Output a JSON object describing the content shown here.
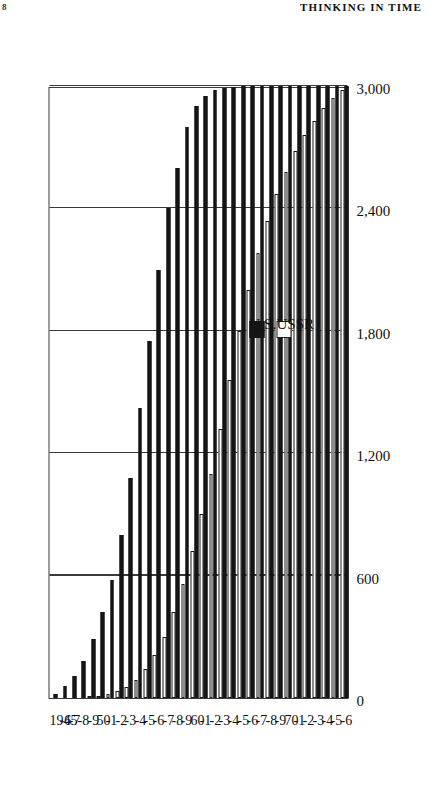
{
  "page": {
    "page_number": "8",
    "running_head": "THINKING IN TIME"
  },
  "legend": {
    "items": [
      {
        "label": "U.S.",
        "swatch": "filled-black-square",
        "color": "#151515"
      },
      {
        "label": "USSR",
        "swatch": "outline-white-square",
        "color": "#ffffff"
      }
    ]
  },
  "chart_data": {
    "type": "bar",
    "orientation": "horizontal",
    "title": "",
    "xlabel": "",
    "ylabel": "",
    "grid": true,
    "legend_position": "inside-left",
    "value_axis": {
      "ticks": [
        "0",
        "600",
        "1,200",
        "1,800",
        "2,400",
        "3,000"
      ],
      "values": [
        0,
        600,
        1200,
        1800,
        2400,
        3000
      ],
      "min": 0,
      "max": 3000
    },
    "categories": [
      "1945",
      "-6",
      "-7",
      "-8",
      "-9",
      "50",
      "-1",
      "-2",
      "-3",
      "-4",
      "-5",
      "-6",
      "-7",
      "-8",
      "-9",
      "60",
      "-1",
      "-2",
      "-3",
      "-4",
      "-5",
      "-6",
      "-7",
      "-8",
      "-9",
      "70",
      "-1",
      "-2",
      "-3",
      "-4",
      "-5",
      "-6"
    ],
    "series": [
      {
        "name": "U.S.",
        "color": "#151515",
        "values": [
          20,
          60,
          110,
          180,
          290,
          420,
          580,
          800,
          1080,
          1420,
          1750,
          2100,
          2400,
          2600,
          2800,
          2900,
          2950,
          2980,
          2990,
          2995,
          3000,
          3000,
          3000,
          3000,
          3000,
          3000,
          3000,
          3000,
          3000,
          3000,
          3000,
          3000
        ]
      },
      {
        "name": "USSR",
        "color": "#ffffff",
        "values": [
          0,
          0,
          0,
          0,
          5,
          10,
          20,
          35,
          55,
          90,
          140,
          210,
          300,
          420,
          560,
          720,
          900,
          1100,
          1320,
          1560,
          1800,
          2000,
          2180,
          2340,
          2470,
          2580,
          2680,
          2760,
          2830,
          2890,
          2940,
          2980
        ]
      }
    ]
  }
}
